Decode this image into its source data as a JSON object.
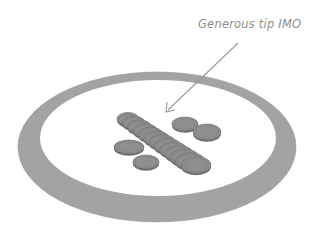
{
  "annotation": {
    "text": "Generous tip IMO"
  },
  "illustration": {
    "subject": "plate-with-coins",
    "coin_count": 17,
    "colors": {
      "plate_rim": "#a3a3a3",
      "plate_face": "#ffffff",
      "coin_fill": "#8f8f8f",
      "coin_edge": "#6e6e6e",
      "arrow": "#9a9a9a",
      "caption": "#8e8e8e"
    }
  }
}
